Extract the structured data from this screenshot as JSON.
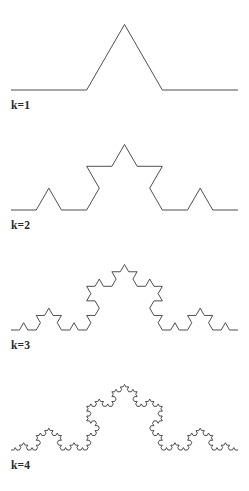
{
  "figure": {
    "background_color": "#ffffff",
    "stroke_color": "#3b3b3b",
    "label_color": "#2a2a2a",
    "width": 249,
    "height": 491
  },
  "panels": [
    {
      "id": "k1",
      "label": "k=1",
      "iteration": 1,
      "segments": 4,
      "label_x": 11,
      "label_y": 107
    },
    {
      "id": "k2",
      "label": "k=2",
      "iteration": 2,
      "segments": 16,
      "label_x": 11,
      "label_y": 227
    },
    {
      "id": "k3",
      "label": "k=3",
      "iteration": 3,
      "segments": 64,
      "label_x": 11,
      "label_y": 347
    },
    {
      "id": "k4",
      "label": "k=4",
      "iteration": 4,
      "segments": 256,
      "label_x": 11,
      "label_y": 467
    }
  ],
  "chart_data": {
    "type": "line",
    "xlabel": "",
    "ylabel": "",
    "grid": false,
    "legend": "none",
    "geometry": {
      "start_x": 11,
      "end_x": 238,
      "span": 227,
      "baseline_offset_from_panel_top": 90,
      "peak_angle_degrees": 60,
      "rule": "Each straight segment is replaced by four segments of one third the length, with the middle third raised into an equilateral triangular bump."
    },
    "series": [
      {
        "name": "k=1",
        "iteration": 1,
        "segments": 4,
        "baseline_y": 90,
        "apex_y": 26
      },
      {
        "name": "k=2",
        "iteration": 2,
        "segments": 16,
        "baseline_y": 90,
        "apex_y": 26
      },
      {
        "name": "k=3",
        "iteration": 3,
        "segments": 64,
        "baseline_y": 90,
        "apex_y": 26
      },
      {
        "name": "k=4",
        "iteration": 4,
        "segments": 256,
        "baseline_y": 90,
        "apex_y": 26
      }
    ],
    "categories": [
      "k=1",
      "k=2",
      "k=3",
      "k=4"
    ],
    "values": [
      4,
      16,
      64,
      256
    ]
  }
}
